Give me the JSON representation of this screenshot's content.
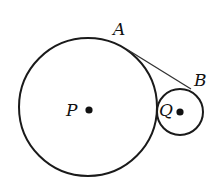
{
  "diagram": {
    "type": "geometry",
    "stroke_color": "#1a1a1a",
    "circles": [
      {
        "name": "P",
        "center_label": "P",
        "cx": 88,
        "cy": 107,
        "r": 69
      },
      {
        "name": "Q",
        "center_label": "Q",
        "cx": 180,
        "cy": 112,
        "r": 23
      }
    ],
    "points": [
      {
        "label": "A",
        "x": 128,
        "y": 50
      },
      {
        "label": "B",
        "x": 191,
        "y": 89
      }
    ],
    "segments": [
      {
        "from": "A",
        "to": "B"
      }
    ],
    "labels": {
      "A": "A",
      "B": "B",
      "P": "P",
      "Q": "Q"
    }
  }
}
